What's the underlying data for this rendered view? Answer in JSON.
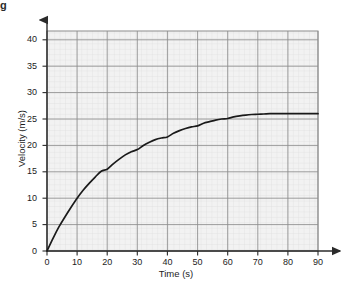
{
  "figure": {
    "corner_mark": "g",
    "background_color": "#ffffff",
    "plot_background_color": "#f2f2f2",
    "major_grid_color": "#8c8c8c",
    "minor_grid_color": "#d8d8d8",
    "axis_color": "#2b2b2b",
    "curve_color": "#1a1a1a"
  },
  "chart_data": {
    "type": "line",
    "title": "",
    "subtitle": "",
    "xlabel": "Time (s)",
    "ylabel": "Velocity (m/s)",
    "xlim": [
      0,
      90
    ],
    "ylim": [
      0,
      42
    ],
    "xticks": [
      0,
      10,
      20,
      30,
      40,
      50,
      60,
      70,
      80,
      90
    ],
    "yticks": [
      0,
      5,
      10,
      15,
      20,
      25,
      30,
      35,
      40
    ],
    "xtick_labels": [
      "0",
      "10",
      "20",
      "30",
      "40",
      "50",
      "60",
      "70",
      "80",
      "90"
    ],
    "ytick_labels": [
      "0",
      "5",
      "10",
      "15",
      "20",
      "25",
      "30",
      "35",
      "40"
    ],
    "x_minor_step": 2,
    "y_minor_step": 1,
    "grid": true,
    "legend": false,
    "legend_position": "none",
    "annotations": [],
    "series": [
      {
        "name": "Velocity",
        "x": [
          0,
          2,
          4,
          6,
          8,
          10,
          12,
          14,
          16,
          18,
          20,
          22,
          24,
          26,
          28,
          30,
          32,
          34,
          36,
          38,
          40,
          42,
          44,
          46,
          48,
          50,
          52,
          54,
          56,
          58,
          60,
          62,
          64,
          66,
          68,
          70,
          72,
          74,
          76,
          78,
          80,
          82,
          84,
          86,
          88,
          90
        ],
        "values": [
          0,
          2.4,
          4.6,
          6.5,
          8.3,
          10.0,
          11.5,
          12.8,
          14.0,
          15.1,
          15.5,
          16.5,
          17.4,
          18.2,
          18.8,
          19.2,
          20.0,
          20.6,
          21.1,
          21.4,
          21.6,
          22.3,
          22.8,
          23.2,
          23.5,
          23.7,
          24.2,
          24.5,
          24.8,
          25.0,
          25.1,
          25.4,
          25.6,
          25.75,
          25.85,
          25.9,
          25.95,
          26.0,
          26.0,
          26.0,
          26.0,
          26.0,
          26.0,
          26.0,
          26.0,
          26.0
        ],
        "terminal_value": 26
      }
    ]
  }
}
